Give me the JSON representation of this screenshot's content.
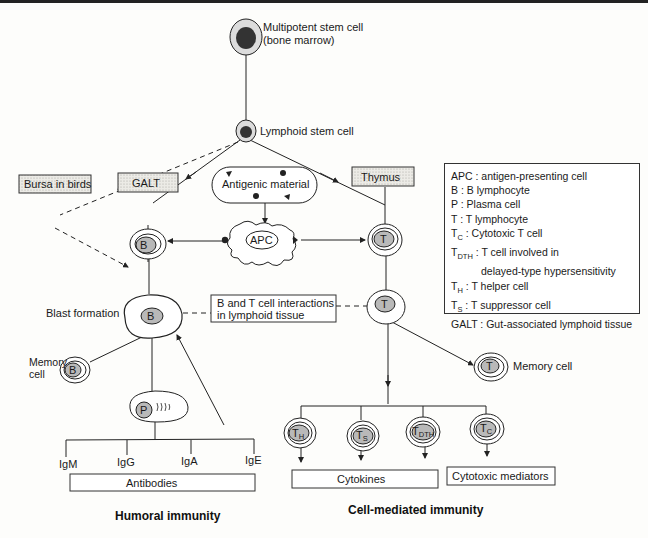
{
  "title_top": {
    "multipotent": "Multipotent stem cell",
    "bone_marrow": "(bone marrow)",
    "lymphoid": "Lymphoid stem cell"
  },
  "boxes": {
    "bursa": "Bursa in birds",
    "galt": "GALT",
    "antigenic": "Antigenic material",
    "thymus": "Thymus",
    "interaction_1": "B and T cell interactions",
    "interaction_2": "in lymphoid tissue",
    "antibodies": "Antibodies",
    "cytokines": "Cytokines",
    "cytotoxic": "Cytotoxic mediators"
  },
  "cells": {
    "apc": "APC",
    "b": "B",
    "t": "T",
    "p": "P",
    "th_main": "T",
    "th_sub": "H",
    "ts_main": "T",
    "ts_sub": "S",
    "tdth_main": "T",
    "tdth_sub": "DTH",
    "tc_main": "T",
    "tc_sub": "C"
  },
  "labels": {
    "blast": "Blast formation",
    "memory_b_1": "Memory",
    "memory_b_2": "cell",
    "memory_t": "Memory cell",
    "igm": "IgM",
    "igg": "IgG",
    "iga": "IgA",
    "ige": "IgE",
    "humoral": "Humoral immunity",
    "cell_mediated": "Cell-mediated immunity"
  },
  "legend": {
    "apc": "APC : antigen-presenting cell",
    "b": "B : B lymphocyte",
    "p": "P : Plasma cell",
    "t": "T : T lymphocyte",
    "tc_pre": "T",
    "tc_sub": "C",
    "tc_text": " : Cytotoxic T cell",
    "tdth_pre": "T",
    "tdth_sub": "DTH",
    "tdth_text": " : T cell involved in",
    "tdth_text2": "delayed-type hypersensitivity",
    "th_pre": "T",
    "th_sub": "H",
    "th_text": " : T helper cell",
    "ts_pre": "T",
    "ts_sub": "S",
    "ts_text": " : T suppressor cell",
    "galt": "GALT : Gut-associated lymphoid tissue"
  },
  "colors": {
    "nucleus_dark": "#333333",
    "nucleus_grey": "#b9b9b9",
    "cell_outer": "#dcdcdc",
    "stipple": "#e4e4e0",
    "line": "#222222"
  }
}
